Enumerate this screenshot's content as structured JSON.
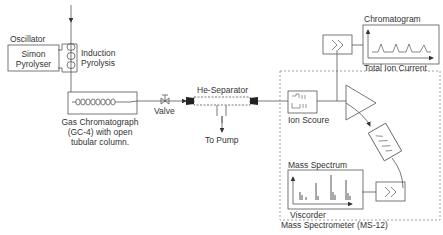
{
  "diagram": {
    "labels": {
      "oscillator": "Oscillator",
      "pyrolyser_line1": "Simon",
      "pyrolyser_line2": "Pyrolyser",
      "induction_line1": "Induction",
      "induction_line2": "Pyrolysis",
      "gc_line1": "Gas Chromatograph",
      "gc_line2": "(GC-4) with open",
      "gc_line3": "tubular column.",
      "valve": "Valve",
      "separator": "He-Separator",
      "pump": "To Pump",
      "ion_source": "Ion Scoure",
      "chromatogram": "Chromatogram",
      "total_ion_current": "Total Ion Current",
      "mass_spectrum": "Mass Spectrum",
      "viscorder": "Viscorder",
      "mass_spectrometer": "Mass Spectrometer  (MS-12)"
    },
    "colors": {
      "line": "#555555",
      "dashed": "#888888",
      "text": "#333333"
    }
  }
}
